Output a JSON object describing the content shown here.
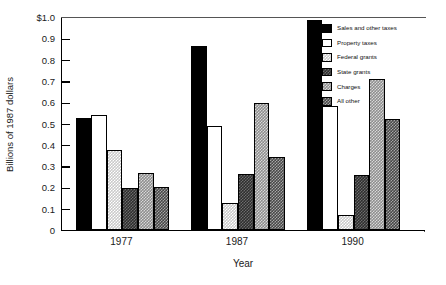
{
  "chart_data": {
    "type": "bar",
    "title": "",
    "subtitle": "",
    "xlabel": "Year",
    "ylabel": "Billions of 1987 dollars",
    "categories": [
      "1977",
      "1987",
      "1990"
    ],
    "ylim": [
      0,
      1.0
    ],
    "ytick_values": [
      0,
      0.1,
      0.2,
      0.3,
      0.4,
      0.5,
      0.6,
      0.7,
      0.8,
      0.9,
      1.0
    ],
    "ytick_labels": [
      "0",
      "0.1",
      "0.2",
      "0.3",
      "0.4",
      "0.5",
      "0.6",
      "0.7",
      "0.8",
      "0.9",
      "$1.0"
    ],
    "grid": false,
    "legend_position": "top-right-inside",
    "series": [
      {
        "name": "Sales and other taxes",
        "pattern": "solid-black",
        "color": "#000000",
        "values": [
          0.525,
          0.865,
          0.985
        ]
      },
      {
        "name": "Property taxes",
        "pattern": "white",
        "color": "#ffffff",
        "values": [
          0.54,
          0.49,
          0.58
        ]
      },
      {
        "name": "Federal grants",
        "pattern": "light-gray",
        "color": "#c9c9c9",
        "values": [
          0.375,
          0.125,
          0.07
        ]
      },
      {
        "name": "State grants",
        "pattern": "dark-check",
        "color": "#2e2e2e",
        "values": [
          0.195,
          0.265,
          0.26
        ]
      },
      {
        "name": "Charges",
        "pattern": "mid-check",
        "color": "#8e8e8e",
        "values": [
          0.27,
          0.595,
          0.71
        ]
      },
      {
        "name": "All other",
        "pattern": "dark-hatch",
        "color": "#484848",
        "values": [
          0.2,
          0.345,
          0.52
        ]
      }
    ]
  },
  "legend": {
    "items": [
      {
        "label": "Sales and other taxes"
      },
      {
        "label": "Property taxes"
      },
      {
        "label": "Federal grants"
      },
      {
        "label": "State grants"
      },
      {
        "label": "Charges"
      },
      {
        "label": "All other"
      }
    ]
  },
  "axes": {
    "y_title": "Billions of 1987 dollars",
    "x_title": "Year"
  }
}
